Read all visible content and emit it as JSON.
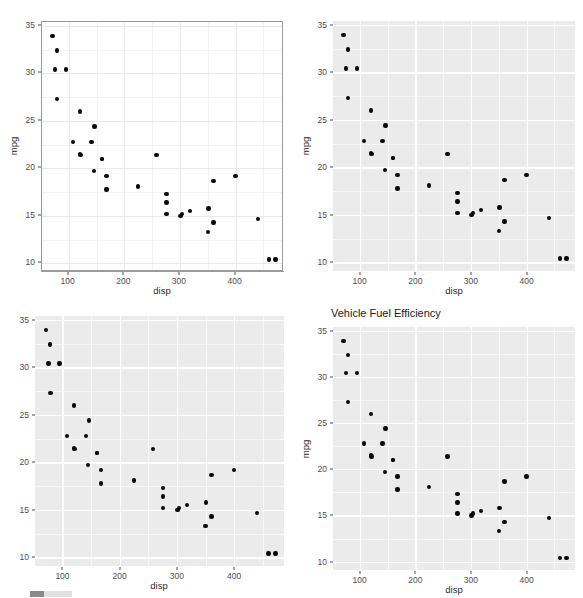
{
  "figure": {
    "layout": "2x2-grid",
    "width": 583,
    "height": 598,
    "background": "#ffffff",
    "point_color": "#0a0a0a"
  },
  "panels": [
    {
      "id": "top-left",
      "theme": "theme-bw",
      "panel_background": "#ffffff",
      "grid_color": "#e8e8ee",
      "border_color": "#9a9a9a",
      "title": "",
      "xlabel": "disp",
      "ylabel": "mpg"
    },
    {
      "id": "top-right",
      "theme": "theme-gray",
      "panel_background": "#ebebeb",
      "grid_color": "#ffffff",
      "border_color": "",
      "title": "",
      "xlabel": "disp",
      "ylabel": "mpg"
    },
    {
      "id": "bottom-left",
      "theme": "theme-gray",
      "panel_background": "#ebebeb",
      "grid_color": "#ffffff",
      "border_color": "",
      "title": "",
      "xlabel": "disp",
      "ylabel": ""
    },
    {
      "id": "bottom-right",
      "theme": "theme-gray",
      "panel_background": "#ebebeb",
      "grid_color": "#ffffff",
      "border_color": "",
      "title": "Vehicle Fuel Efficiency",
      "xlabel": "disp",
      "ylabel": "mpg"
    }
  ],
  "axis": {
    "x_ticks": [
      100,
      200,
      300,
      400
    ],
    "x_tick_labels": [
      "100",
      "200",
      "300",
      "400"
    ],
    "y_ticks": [
      10,
      15,
      20,
      25,
      30,
      35
    ],
    "y_tick_labels": [
      "10",
      "15",
      "20",
      "25",
      "30",
      "35"
    ],
    "x_minor_ticks": [
      150,
      250,
      350,
      450
    ],
    "y_minor_ticks": [
      12.5,
      17.5,
      22.5,
      27.5,
      32.5
    ],
    "xlim": [
      52,
      487
    ],
    "ylim": [
      9.1,
      35.4
    ]
  },
  "chart_data": {
    "type": "scatter",
    "title": "Vehicle Fuel Efficiency",
    "xlabel": "disp",
    "ylabel": "mpg",
    "xlim": [
      52,
      487
    ],
    "ylim": [
      9.1,
      35.4
    ],
    "grid": true,
    "legend": null,
    "repeated_in_panels": 4,
    "x": [
      160,
      160,
      108,
      258,
      360,
      225,
      360,
      146.7,
      140.8,
      167.6,
      167.6,
      275.8,
      275.8,
      275.8,
      472,
      460,
      440,
      78.7,
      75.7,
      71.1,
      120.1,
      318,
      304,
      350,
      400,
      79,
      120.3,
      95.1,
      351,
      145,
      301,
      121
    ],
    "y": [
      21,
      21,
      22.8,
      21.4,
      18.7,
      18.1,
      14.3,
      24.4,
      22.8,
      19.2,
      17.8,
      16.4,
      17.3,
      15.2,
      10.4,
      10.4,
      14.7,
      32.4,
      30.4,
      33.9,
      21.5,
      15.5,
      15.2,
      13.3,
      19.2,
      27.3,
      26,
      30.4,
      15.8,
      19.7,
      15,
      21.4
    ],
    "series": [
      {
        "name": "mtcars",
        "points": [
          [
            160,
            21
          ],
          [
            160,
            21
          ],
          [
            108,
            22.8
          ],
          [
            258,
            21.4
          ],
          [
            360,
            18.7
          ],
          [
            225,
            18.1
          ],
          [
            360,
            14.3
          ],
          [
            146.7,
            24.4
          ],
          [
            140.8,
            22.8
          ],
          [
            167.6,
            19.2
          ],
          [
            167.6,
            17.8
          ],
          [
            275.8,
            16.4
          ],
          [
            275.8,
            17.3
          ],
          [
            275.8,
            15.2
          ],
          [
            472,
            10.4
          ],
          [
            460,
            10.4
          ],
          [
            440,
            14.7
          ],
          [
            78.7,
            32.4
          ],
          [
            75.7,
            30.4
          ],
          [
            71.1,
            33.9
          ],
          [
            120.1,
            21.5
          ],
          [
            318,
            15.5
          ],
          [
            304,
            15.2
          ],
          [
            350,
            13.3
          ],
          [
            400,
            19.2
          ],
          [
            79,
            27.3
          ],
          [
            120.3,
            26
          ],
          [
            95.1,
            30.4
          ],
          [
            351,
            15.8
          ],
          [
            145,
            19.7
          ],
          [
            301,
            15
          ],
          [
            121,
            21.4
          ]
        ]
      }
    ]
  }
}
